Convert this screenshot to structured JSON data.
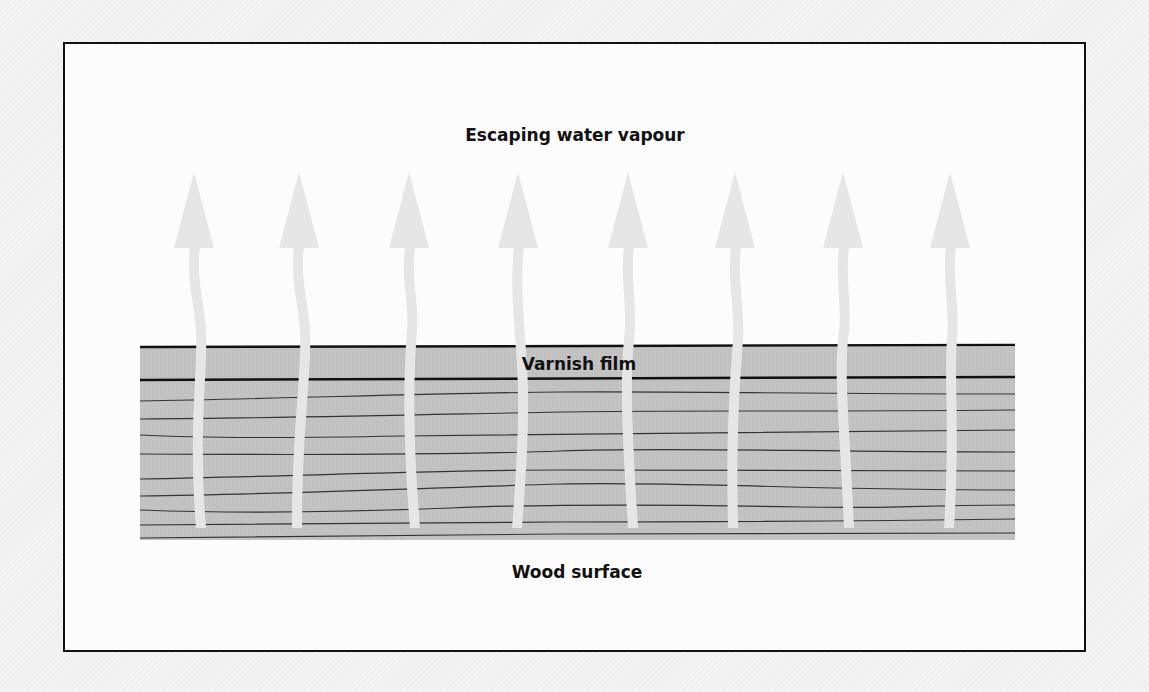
{
  "diagram": {
    "labels": {
      "top": "Escaping water vapour",
      "middle": "Varnish film",
      "bottom": "Wood surface"
    },
    "arrow_count": 8,
    "arrow_x_positions": [
      194,
      298,
      409,
      518,
      628,
      735,
      843,
      950
    ],
    "colors": {
      "frame": "#111111",
      "panel_background": "#fcfcfc",
      "varnish_fill": "#c4c4c4",
      "wood_fill": "#bdbdbd",
      "grain_lines": "#333333",
      "arrows": "#e6e6e6"
    }
  }
}
